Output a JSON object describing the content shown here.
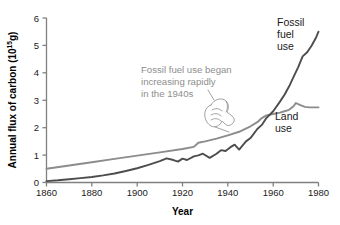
{
  "chart_data": {
    "type": "line",
    "title": "",
    "xlabel": "Year",
    "ylabel": "Annual flux of carbon (10",
    "ylabel_sup": "15",
    "ylabel_tail": "g)",
    "xlim": [
      1860,
      1980
    ],
    "ylim": [
      0,
      6
    ],
    "grid": false,
    "legend_position": "inline-right",
    "xticks": [
      "1860",
      "1880",
      "1900",
      "1920",
      "1940",
      "1960",
      "1980"
    ],
    "xtick_values": [
      1860,
      1880,
      1900,
      1920,
      1940,
      1960,
      1980
    ],
    "yticks": [
      "0",
      "1",
      "2",
      "3",
      "4",
      "5",
      "6"
    ],
    "ytick_values": [
      0,
      1,
      2,
      3,
      4,
      5,
      6
    ],
    "series": [
      {
        "name": "Fossil fuel use",
        "label_lines": [
          "Fossil",
          "fuel",
          "use"
        ],
        "color": "#4d4d4d",
        "stroke_width": 1.9,
        "x": [
          1860,
          1865,
          1870,
          1875,
          1880,
          1885,
          1890,
          1895,
          1900,
          1905,
          1910,
          1913,
          1916,
          1918,
          1920,
          1922,
          1925,
          1927,
          1929,
          1932,
          1935,
          1937,
          1939,
          1941,
          1943,
          1945,
          1946,
          1948,
          1950,
          1953,
          1955,
          1957,
          1960,
          1963,
          1965,
          1967,
          1969,
          1971,
          1973,
          1975,
          1977,
          1979,
          1980
        ],
        "y": [
          0.05,
          0.08,
          0.12,
          0.16,
          0.2,
          0.26,
          0.33,
          0.42,
          0.52,
          0.64,
          0.78,
          0.88,
          0.82,
          0.76,
          0.87,
          0.82,
          0.95,
          0.99,
          1.05,
          0.9,
          1.05,
          1.18,
          1.15,
          1.28,
          1.38,
          1.2,
          1.3,
          1.5,
          1.62,
          1.95,
          2.1,
          2.35,
          2.6,
          2.95,
          3.2,
          3.5,
          3.85,
          4.2,
          4.6,
          4.75,
          5.0,
          5.3,
          5.5
        ]
      },
      {
        "name": "Land use",
        "label_lines": [
          "Land",
          "use"
        ],
        "color": "#8c8c8c",
        "stroke_width": 1.9,
        "x": [
          1860,
          1870,
          1880,
          1890,
          1900,
          1910,
          1920,
          1925,
          1927,
          1930,
          1935,
          1940,
          1945,
          1950,
          1953,
          1955,
          1957,
          1960,
          1963,
          1965,
          1967,
          1969,
          1970,
          1972,
          1974,
          1976,
          1978,
          1980
        ],
        "y": [
          0.5,
          0.62,
          0.74,
          0.86,
          0.98,
          1.1,
          1.22,
          1.3,
          1.45,
          1.5,
          1.6,
          1.72,
          1.85,
          2.05,
          2.2,
          2.35,
          2.45,
          2.5,
          2.55,
          2.6,
          2.65,
          2.78,
          2.9,
          2.82,
          2.76,
          2.74,
          2.74,
          2.74
        ]
      }
    ],
    "annotations": [
      {
        "name": "fossil-fuel-rapid-increase-note",
        "lines": [
          "Fossil fuel use began",
          "increasing rapidly",
          "in the 1940s"
        ],
        "color": "#8e8e8e",
        "points_at_year": 1943,
        "points_at_value": 1.38
      }
    ]
  },
  "icons": {
    "pointing_hand": "pointing-hand-icon"
  }
}
